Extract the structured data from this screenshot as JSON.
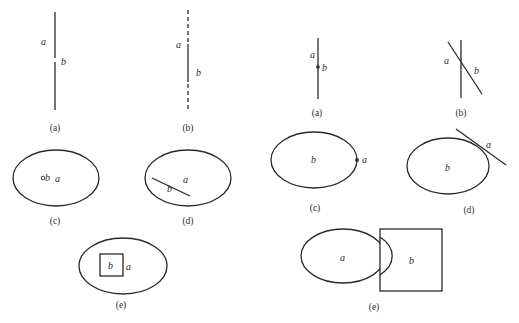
{
  "left_panel": {
    "a": {
      "caption": "(a)",
      "label_a": "a",
      "label_b": "b",
      "description": "Two collinear vertical segments a (upper) and b (lower) with a small gap"
    },
    "b": {
      "caption": "(b)",
      "label_a": "a",
      "label_b": "b",
      "description": "Solid segment on a dashed vertical line"
    },
    "c": {
      "caption": "(c)",
      "label_a": "a",
      "label_b": "b",
      "description": "Small point b inside ellipse a"
    },
    "d": {
      "caption": "(d)",
      "label_a": "a",
      "label_b": "b",
      "description": "Line segment b inside ellipse a"
    },
    "e": {
      "caption": "(e)",
      "label_a": "a",
      "label_b": "b",
      "description": "Square b inside ellipse a"
    }
  },
  "right_panel": {
    "a": {
      "caption": "(a)",
      "label_a": "a",
      "label_b": "b",
      "description": "Point b lying on vertical line a"
    },
    "b": {
      "caption": "(b)",
      "label_a": "a",
      "label_b": "b",
      "description": "Two crossing lines a and b"
    },
    "c": {
      "caption": "(c)",
      "label_a": "a",
      "label_b": "b",
      "description": "Point a on the boundary of ellipse b"
    },
    "d": {
      "caption": "(d)",
      "label_a": "a",
      "label_b": "b",
      "description": "Line a tangent to ellipse b"
    },
    "e": {
      "caption": "(e)",
      "label_a": "a",
      "label_b": "b",
      "description": "Ellipse a overlapping square b"
    }
  },
  "colors": {
    "stroke": "#2a2a2a",
    "background": "#ffffff"
  }
}
